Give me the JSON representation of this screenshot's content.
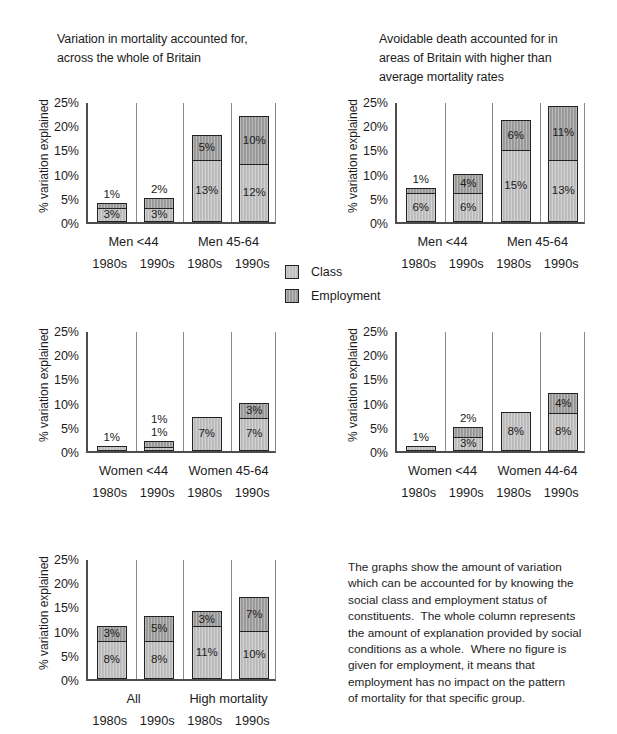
{
  "colors": {
    "class_fill": "#bfbfbf",
    "employment_fill": "#9c9c9c",
    "bar_border": "#222222",
    "axis_line": "#4d4d4d",
    "separator_line": "#8a8a8a",
    "text": "#1c1c1c",
    "background": "#ffffff"
  },
  "legend": {
    "entries": [
      "Class",
      "Employment"
    ]
  },
  "note": {
    "text": "The graphs show the amount of variation\nwhich can be accounted for by knowing the\nsocial class and employment status of\nconstituents.  The whole column represents\nthe amount of explanation provided by social\nconditions as a whole.  Where no figure is\ngiven for employment, it means that\nemployment has no impact on the pattern\nof mortality for that specific group."
  },
  "chart_data": [
    {
      "type": "bar",
      "stacked": true,
      "title_lines": [
        "Variation in mortality accounted for,",
        "across the whole of Britain"
      ],
      "ylabel": "% variation explained",
      "ylim": [
        0,
        25
      ],
      "ytick_labels": [
        "0%",
        "5%",
        "10%",
        "15%",
        "20%",
        "25%"
      ],
      "group_labels": [
        "Men <44",
        "Men 45-64"
      ],
      "categories": [
        "1980s",
        "1990s",
        "1980s",
        "1990s"
      ],
      "series": [
        {
          "name": "Class",
          "values": [
            3,
            3,
            13,
            12
          ]
        },
        {
          "name": "Employment",
          "values": [
            1,
            2,
            5,
            10
          ]
        }
      ]
    },
    {
      "type": "bar",
      "stacked": true,
      "title_lines": [
        "Avoidable death accounted for in",
        "areas of Britain with higher than",
        "average mortality rates"
      ],
      "ylabel": "% variation explained",
      "ylim": [
        0,
        25
      ],
      "ytick_labels": [
        "0%",
        "5%",
        "10%",
        "15%",
        "20%",
        "25%"
      ],
      "group_labels": [
        "Men <44",
        "Men 45-64"
      ],
      "categories": [
        "1980s",
        "1990s",
        "1980s",
        "1990s"
      ],
      "series": [
        {
          "name": "Class",
          "values": [
            6,
            6,
            15,
            13
          ]
        },
        {
          "name": "Employment",
          "values": [
            1,
            4,
            6,
            11
          ]
        }
      ]
    },
    {
      "type": "bar",
      "stacked": true,
      "title_lines": [],
      "ylabel": "% variation explained",
      "ylim": [
        0,
        25
      ],
      "ytick_labels": [
        "0%",
        "5%",
        "10%",
        "15%",
        "20%",
        "25%"
      ],
      "group_labels": [
        "Women <44",
        "Women 45-64"
      ],
      "categories": [
        "1980s",
        "1990s",
        "1980s",
        "1990s"
      ],
      "series": [
        {
          "name": "Class",
          "values": [
            1,
            1,
            7,
            7
          ]
        },
        {
          "name": "Employment",
          "values": [
            0,
            1,
            0,
            3
          ]
        }
      ]
    },
    {
      "type": "bar",
      "stacked": true,
      "title_lines": [],
      "ylabel": "% variation explained",
      "ylim": [
        0,
        25
      ],
      "ytick_labels": [
        "0%",
        "5%",
        "10%",
        "15%",
        "20%",
        "25%"
      ],
      "group_labels": [
        "Women <44",
        "Women 44-64"
      ],
      "categories": [
        "1980s",
        "1990s",
        "1980s",
        "1990s"
      ],
      "series": [
        {
          "name": "Class",
          "values": [
            1,
            3,
            8,
            8
          ]
        },
        {
          "name": "Employment",
          "values": [
            0,
            2,
            0,
            4
          ]
        }
      ]
    },
    {
      "type": "bar",
      "stacked": true,
      "title_lines": [],
      "ylabel": "% variation explained",
      "ylim": [
        0,
        25
      ],
      "ytick_labels": [
        "0%",
        "5%",
        "10%",
        "15%",
        "20%",
        "25%"
      ],
      "group_labels": [
        "All",
        "High mortality"
      ],
      "categories": [
        "1980s",
        "1990s",
        "1980s",
        "1990s"
      ],
      "series": [
        {
          "name": "Class",
          "values": [
            8,
            8,
            11,
            10
          ]
        },
        {
          "name": "Employment",
          "values": [
            3,
            5,
            3,
            7
          ]
        }
      ]
    }
  ]
}
